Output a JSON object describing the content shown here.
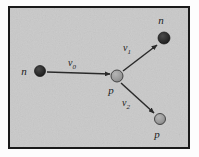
{
  "figure": {
    "kind": "physics-collision-diagram",
    "frame": {
      "border_color": "#1a1a1a",
      "fill_color": "#c9c9c9",
      "page_color": "#fdfdfd",
      "x": 8,
      "y": 6,
      "width": 182,
      "height": 143,
      "border_width": 2
    },
    "colors": {
      "neutron_fill": "#2b2b2b",
      "neutron_stroke": "#141414",
      "proton_fill": "#9a9a9a",
      "proton_stroke": "#3a3a3a",
      "arrow_color": "#2a2a2a",
      "label_color": "#1c1c1c"
    },
    "particles": [
      {
        "id": "incoming-neutron",
        "symbol": "n",
        "type": "neutron",
        "cx": 40,
        "cy": 71,
        "r": 5.5,
        "label_x": 24,
        "label_y": 75
      },
      {
        "id": "target-proton",
        "symbol": "p",
        "type": "proton",
        "cx": 117,
        "cy": 76,
        "r": 6,
        "label_x": 111,
        "label_y": 94
      },
      {
        "id": "scattered-neutron",
        "symbol": "n",
        "type": "neutron",
        "cx": 164,
        "cy": 38,
        "r": 6,
        "label_x": 161,
        "label_y": 24
      },
      {
        "id": "recoil-proton",
        "symbol": "p",
        "type": "proton",
        "cx": 160,
        "cy": 119,
        "r": 5.5,
        "label_x": 157,
        "label_y": 138
      }
    ],
    "vectors": [
      {
        "id": "v0",
        "symbol": "v",
        "subscript": "0",
        "x1": 47,
        "y1": 72,
        "x2": 110,
        "y2": 74,
        "label_x": 72,
        "label_y": 66
      },
      {
        "id": "v1",
        "symbol": "v",
        "subscript": "1",
        "x1": 123,
        "y1": 71,
        "x2": 157,
        "y2": 45,
        "label_x": 127,
        "label_y": 51
      },
      {
        "id": "v2",
        "symbol": "v",
        "subscript": "2",
        "x1": 121,
        "y1": 83,
        "x2": 154,
        "y2": 113,
        "label_x": 126,
        "label_y": 106
      }
    ]
  }
}
